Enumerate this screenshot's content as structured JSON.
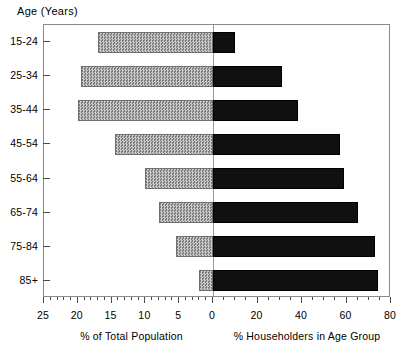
{
  "chart_data": {
    "type": "bar",
    "title": "",
    "subtitle": "",
    "orientation": "horizontal",
    "style": "back-to-back population pyramid",
    "ylabel": "Age (Years)",
    "categories": [
      "15-24",
      "25-34",
      "35-44",
      "45-54",
      "55-64",
      "65-74",
      "75-84",
      "85+"
    ],
    "grid": false,
    "legend": "none",
    "left_axis": {
      "label": "% of Total Population",
      "series_name": "% of Total Population",
      "values": [
        17.0,
        19.5,
        20.0,
        14.5,
        10.0,
        8.0,
        5.5,
        2.0
      ],
      "xlim": [
        25,
        0
      ],
      "direction": "right-to-left",
      "ticks": [
        25,
        20,
        15,
        10,
        5,
        0
      ],
      "tick_labels": [
        "25",
        "20",
        "15",
        "10",
        "5",
        "0"
      ],
      "minor_tick_step": 1,
      "fill": "#9d9d9d",
      "pattern": "checkered-gray"
    },
    "right_axis": {
      "label": "% Householders in Age Group",
      "series_name": "% Householders in Age Group",
      "values": [
        10.0,
        31.0,
        38.0,
        57.0,
        59.0,
        65.0,
        73.0,
        74.0
      ],
      "xlim": [
        0,
        80
      ],
      "direction": "left-to-right",
      "ticks": [
        0,
        20,
        40,
        60,
        80
      ],
      "tick_labels": [
        "0",
        "20",
        "40",
        "60",
        "80"
      ],
      "minor_tick_step": 5,
      "fill": "#101010"
    }
  },
  "colors": {
    "left_bar": "#9d9d9d",
    "right_bar": "#101010",
    "frame": "#8a8a8a",
    "axis": "#4a4a4a",
    "background": "#ffffff"
  }
}
